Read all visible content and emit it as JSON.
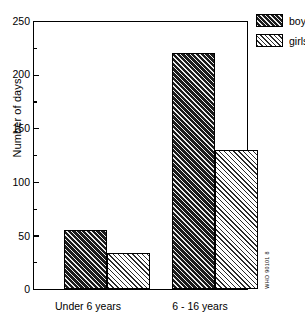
{
  "chart_data": {
    "type": "bar",
    "title": "",
    "xlabel": "",
    "ylabel": "Number of days",
    "categories": [
      "Under 6 years",
      "6 - 16 years"
    ],
    "series": [
      {
        "name": "boys",
        "values": [
          55,
          220
        ]
      },
      {
        "name": "girls",
        "values": [
          34,
          130
        ]
      }
    ],
    "ylim": [
      0,
      250
    ],
    "yticks": [
      0,
      50,
      100,
      150,
      200,
      250
    ],
    "ytick_labels": [
      "0",
      "50",
      "100",
      "150",
      "200",
      "250"
    ],
    "yminor_ticks": [
      25,
      75,
      125,
      175,
      225
    ],
    "grid": false,
    "legend_position": "top-right-outside",
    "legend_entries": [
      "boys",
      "girls"
    ],
    "colors": {
      "boys_fill": "#1c1c1c",
      "girls_fill": "#ffffff",
      "hatch": "#2a2a2a",
      "axis": "#000000",
      "background": "#ffffff"
    }
  },
  "annotations": {
    "credit": "WHO 90101 8"
  }
}
